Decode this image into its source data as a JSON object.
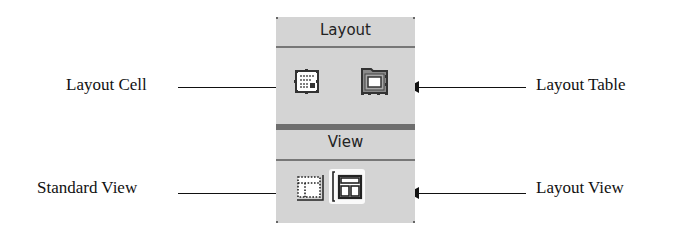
{
  "callouts": {
    "layout_cell": "Layout Cell",
    "layout_table": "Layout Table",
    "standard_view": "Standard View",
    "layout_view": "Layout View"
  },
  "panel": {
    "layout_header": "Layout",
    "view_header": "View",
    "buttons": [
      {
        "name": "layout-cell",
        "icon": "layout-cell-icon"
      },
      {
        "name": "layout-table",
        "icon": "layout-table-icon"
      },
      {
        "name": "standard-view",
        "icon": "standard-view-icon",
        "selected": false
      },
      {
        "name": "layout-view",
        "icon": "layout-view-icon",
        "selected": true
      }
    ]
  },
  "colors": {
    "panel_bg": "#d4d4d4",
    "separator": "#6e6e6e",
    "text": "#111111"
  }
}
